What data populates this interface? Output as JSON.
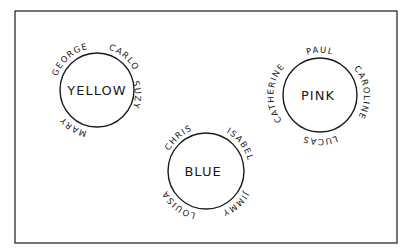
{
  "diagram": {
    "type": "group-circles",
    "groups": [
      {
        "color_name": "YELLOW",
        "members_top": [
          "GEORGE",
          "CARLO"
        ],
        "members_right": [
          "SUZY"
        ],
        "members_left": [
          "MARY"
        ]
      },
      {
        "color_name": "PINK",
        "members_top": [
          "PAUL"
        ],
        "members_right": [
          "CAROLINE"
        ],
        "members_left": [
          "CATHERINE"
        ],
        "members_bottom": [
          "LUCAS"
        ]
      },
      {
        "color_name": "BLUE",
        "members_top": [
          "CHRIS",
          "ISABEL"
        ],
        "members_right": [
          "JIMMY"
        ],
        "members_left": [
          "LOUISA"
        ]
      }
    ]
  },
  "colors": {
    "ink": "#1a1a1a",
    "background": "#ffffff"
  }
}
